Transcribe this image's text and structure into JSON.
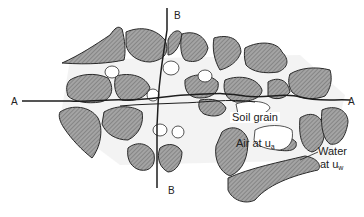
{
  "diagram": {
    "section_lines": {
      "horizontal": {
        "start_label": "A",
        "end_label": "A"
      },
      "vertical": {
        "top_label": "B",
        "bottom_label": "B"
      }
    },
    "labels": {
      "soil_grain": "Soil grain",
      "air_prefix": "Air at u",
      "air_sub": "a",
      "water_line1": "Water",
      "water_prefix": "at u",
      "water_sub": "w"
    },
    "colors": {
      "grain_fill": "#9a9a9a",
      "grain_hatch": "#6f6f6f",
      "outline": "#2a2a2a",
      "background": "#ffffff"
    }
  }
}
